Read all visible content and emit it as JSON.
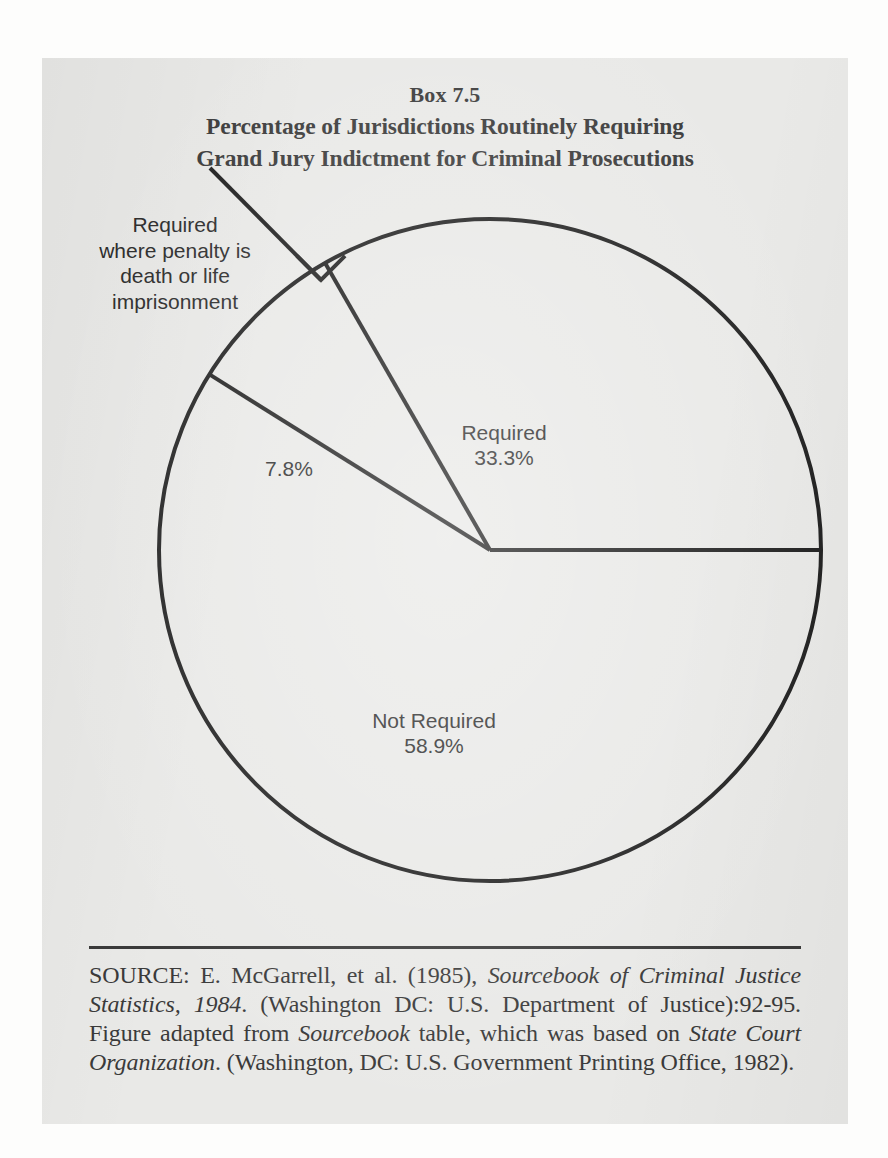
{
  "figure": {
    "box_number": "Box 7.5",
    "title_line_1": "Percentage of Jurisdictions Routinely Requiring",
    "title_line_2": "Grand Jury Indictment for Criminal Prosecutions"
  },
  "callout": {
    "line_1": "Required",
    "line_2": "where penalty is",
    "line_3": "death or life",
    "line_4": "imprisonment"
  },
  "labels": {
    "required_name": "Required",
    "required_value": "33.3%",
    "not_required_name": "Not Required",
    "not_required_value": "58.9%",
    "conditional_value": "7.8%"
  },
  "source": {
    "prefix": "SOURCE:",
    "part_1": "  E. McGarrell, et al. (1985), ",
    "italic_1": "Sourcebook of Criminal Justice Statistics, 1984",
    "part_2": ". (Washington DC: U.S. Department of Justice):92-95.  Figure adapted from ",
    "italic_2": "Sourcebook",
    "part_3": " table, which was based on ",
    "italic_3": "State Court Organization",
    "part_4": ". (Washington, DC:  U.S. Government Printing Office, 1982).",
    "full_text": "SOURCE:  E. McGarrell, et al. (1985), Sourcebook of Criminal Justice Statistics, 1984. (Washington DC: U.S. Department of Justice):92-95.  Figure adapted from Sourcebook table, which was based on State Court Organization. (Washington, DC:  U.S. Government Printing Office, 1982)."
  },
  "chart_data": {
    "type": "pie",
    "title": "Percentage of Jurisdictions Routinely Requiring Grand Jury Indictment for Criminal Prosecutions",
    "categories": [
      "Required",
      "Required where penalty is death or life imprisonment",
      "Not Required"
    ],
    "values": [
      33.3,
      7.8,
      58.9
    ],
    "labels": [
      "33.3%",
      "7.8%",
      "58.9%"
    ],
    "unit": "percent",
    "start_angle_deg": 0,
    "direction": "counterclockwise",
    "legend": "none",
    "grid": false,
    "slice_fill": "#e9e9e7",
    "slice_stroke": "#1f1f1f",
    "center_px": [
      490,
      550
    ],
    "radius_px": 331
  },
  "colors": {
    "paper": "#e9e9e7",
    "page": "#fdfdfc",
    "ink": "#2b2b2b",
    "rule": "#3a3a3a"
  }
}
